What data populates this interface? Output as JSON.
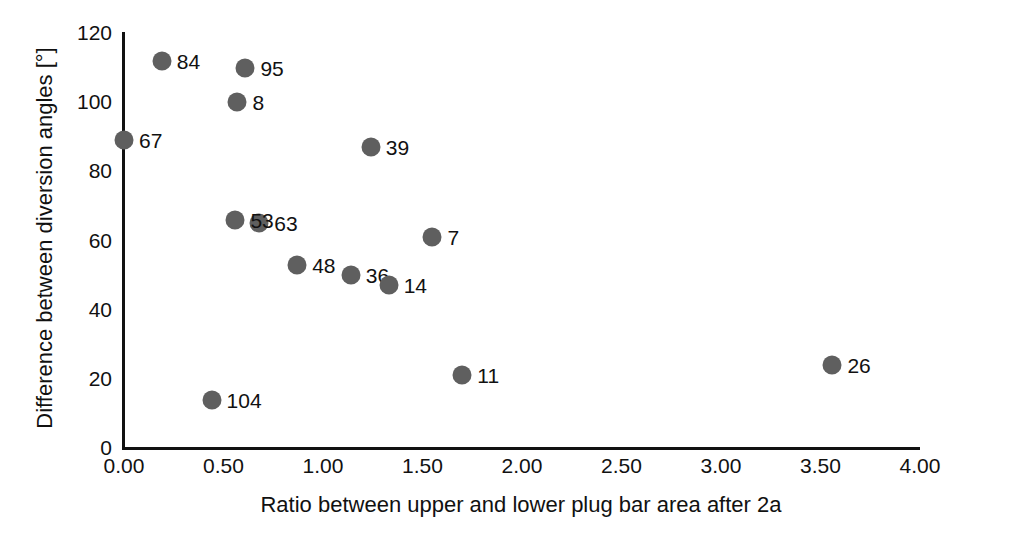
{
  "chart_data": {
    "type": "scatter",
    "title": "",
    "xlabel": "Ratio between upper and lower plug bar area after 2a",
    "ylabel": "Difference between diversion angles [°]",
    "xlim": [
      0.0,
      4.0
    ],
    "ylim": [
      0,
      120
    ],
    "xticks": [
      "0.00",
      "0.50",
      "1.00",
      "1.50",
      "2.00",
      "2.50",
      "3.00",
      "3.50",
      "4.00"
    ],
    "xtick_values": [
      0.0,
      0.5,
      1.0,
      1.5,
      2.0,
      2.5,
      3.0,
      3.5,
      4.0
    ],
    "yticks": [
      "0",
      "20",
      "40",
      "60",
      "80",
      "100",
      "120"
    ],
    "ytick_values": [
      0,
      20,
      40,
      60,
      80,
      100,
      120
    ],
    "grid": false,
    "legend": "none",
    "marker_color": "#5f5f5f",
    "axis_color": "#111111",
    "points": [
      {
        "label": "84",
        "x": 0.19,
        "y": 112
      },
      {
        "label": "95",
        "x": 0.61,
        "y": 110
      },
      {
        "label": "8",
        "x": 0.57,
        "y": 100
      },
      {
        "label": "67",
        "x": 0.0,
        "y": 89
      },
      {
        "label": "39",
        "x": 1.24,
        "y": 87
      },
      {
        "label": "63",
        "x": 0.68,
        "y": 65
      },
      {
        "label": "53",
        "x": 0.56,
        "y": 66
      },
      {
        "label": "7",
        "x": 1.55,
        "y": 61
      },
      {
        "label": "48",
        "x": 0.87,
        "y": 53
      },
      {
        "label": "36",
        "x": 1.14,
        "y": 50
      },
      {
        "label": "14",
        "x": 1.33,
        "y": 47
      },
      {
        "label": "26",
        "x": 3.56,
        "y": 24
      },
      {
        "label": "11",
        "x": 1.7,
        "y": 21
      },
      {
        "label": "104",
        "x": 0.44,
        "y": 14
      }
    ]
  }
}
